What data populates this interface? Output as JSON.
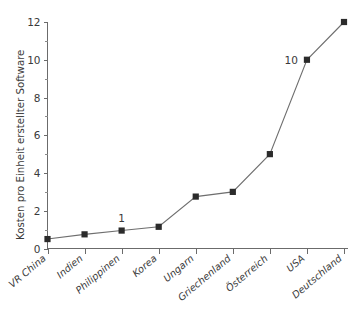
{
  "chart_data": {
    "type": "line",
    "title": "",
    "subtitle": "",
    "xlabel": "",
    "ylabel": "Kosten pro Einheit erstellter Software",
    "categories": [
      "VR China",
      "Indien",
      "Philippinen",
      "Korea",
      "Ungarn",
      "Griechenland",
      "Österreich",
      "USA",
      "Deutschland"
    ],
    "values": [
      0.5,
      0.75,
      0.95,
      1.15,
      2.75,
      3.0,
      5.0,
      10.0,
      12.0
    ],
    "series": [
      {
        "name": "Kosten pro Einheit erstellter Software",
        "values": [
          0.5,
          0.75,
          0.95,
          1.15,
          2.75,
          3.0,
          5.0,
          10.0,
          12.0
        ]
      }
    ],
    "ylim": [
      0,
      12
    ],
    "yticks": [
      0,
      2,
      4,
      6,
      8,
      10,
      12
    ],
    "ytick_labels": [
      "0",
      "2",
      "4",
      "6",
      "8",
      "10",
      "12"
    ],
    "yticks_minor": [
      1,
      3,
      5,
      7,
      9,
      11
    ],
    "grid": false,
    "legend": false,
    "legend_position": "none",
    "marker": "square",
    "annotations": [
      {
        "text": "1",
        "category": "Philippinen",
        "value": 0.95
      },
      {
        "text": "10",
        "category": "USA",
        "value": 10.0
      }
    ],
    "colors": {
      "line": "#6e6e6e",
      "marker": "#2b2b2b",
      "axis": "#6b6b6b",
      "text": "#3a3a3a",
      "background": "#ffffff"
    }
  }
}
